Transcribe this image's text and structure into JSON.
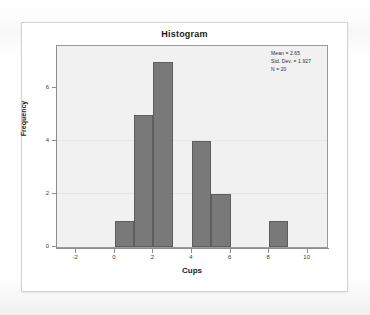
{
  "card": {
    "title": "Histogram"
  },
  "stats": {
    "mean_label": "Mean = 2.65",
    "std_dev_label": "Std. Dev. = 1.927",
    "n_label": "N = 20"
  },
  "axes": {
    "x_title": "Cups",
    "y_title": "Frequency",
    "x_ticks": [
      "-2",
      "0",
      "2",
      "4",
      "6",
      "8",
      "10"
    ],
    "y_ticks": [
      "0",
      "2",
      "4",
      "6"
    ]
  },
  "chart_data": {
    "type": "bar",
    "title": "Histogram",
    "xlabel": "Cups",
    "ylabel": "Frequency",
    "xlim": [
      -3,
      11
    ],
    "ylim": [
      0,
      7.6
    ],
    "grid": false,
    "legend": null,
    "bin_width": 1,
    "bin_starts": [
      0,
      1,
      2,
      3,
      4,
      5,
      6,
      7,
      8
    ],
    "categories": [
      "0-1",
      "1-2",
      "2-3",
      "3-4",
      "4-5",
      "5-6",
      "6-7",
      "7-8",
      "8-9"
    ],
    "values": [
      1,
      5,
      7,
      0,
      4,
      2,
      0,
      0,
      1
    ],
    "annotations": [
      "Mean = 2.65",
      "Std. Dev. = 1.927",
      "N = 20"
    ],
    "statistics": {
      "mean": 2.65,
      "std_dev": 1.927,
      "n": 20
    },
    "colors": {
      "bar_fill": "#797979",
      "bar_edge": "#5e5e5e",
      "plot_background": "#f1f1f1",
      "axis": "#8e8e8e"
    }
  }
}
